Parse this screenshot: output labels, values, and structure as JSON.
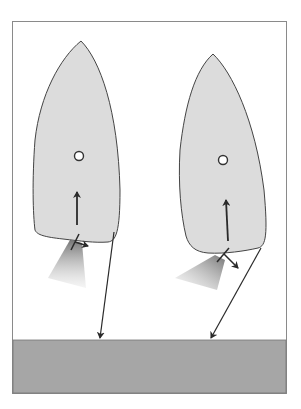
{
  "diagram": {
    "colors": {
      "background": "#ffffff",
      "frame_stroke": "#8a8a8a",
      "hull_fill": "#dcdcdc",
      "hull_stroke": "#444444",
      "dock_fill": "#a6a6a6",
      "arrow": "#2a2a2a",
      "wash": "#7a7a7a"
    },
    "boats": [
      {
        "name": "left boat",
        "pivot_marker": "circle",
        "motion": "forward",
        "stern_thrust": "starboard"
      },
      {
        "name": "right boat",
        "pivot_marker": "circle",
        "motion": "forward",
        "stern_thrust": "starboard-aft"
      }
    ],
    "dock": {
      "label": ""
    }
  }
}
